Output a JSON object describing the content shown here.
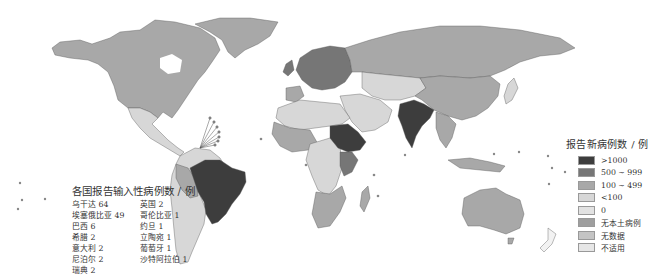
{
  "map": {
    "type": "choropleth",
    "subject": "world map of reported new cases",
    "colors": {
      "ocean": "#ffffff",
      "gt1000": "#3d3d3d",
      "r500_999": "#767676",
      "r100_499": "#a8a8a8",
      "lt100": "#d7d7d7",
      "zero": "#e2e2e2",
      "no_indigenous": "#9e9e9e",
      "no_data": "#c4c4c4",
      "not_applicable": "#e6e6e6",
      "border": "#555555"
    },
    "highlighted_countries_gt1000": [
      "Brazil",
      "India",
      "Sudan",
      "Ethiopia"
    ]
  },
  "import_panel": {
    "title": "各国报告输入性病例数 / 例",
    "left_column": [
      {
        "label": "乌干达 64"
      },
      {
        "label": "埃塞俄比亚 49"
      },
      {
        "label": "巴西 6"
      },
      {
        "label": "希腊 2"
      },
      {
        "label": "意大利 2"
      },
      {
        "label": "尼泊尔 2"
      },
      {
        "label": "瑞典 2"
      }
    ],
    "right_column": [
      {
        "label": "英国 2"
      },
      {
        "label": "哥伦比亚 1"
      },
      {
        "label": "约旦 1"
      },
      {
        "label": "立陶宛 1"
      },
      {
        "label": "葡萄牙 1"
      },
      {
        "label": "沙特阿拉伯 1"
      }
    ]
  },
  "legend": {
    "title": "报告新病例数 / 例",
    "items": [
      {
        "label": ">1000",
        "color": "#3d3d3d"
      },
      {
        "label": "500 ~ 999",
        "color": "#767676"
      },
      {
        "label": "100 ~ 499",
        "color": "#a8a8a8"
      },
      {
        "label": "<100",
        "color": "#d7d7d7"
      },
      {
        "label": "0",
        "color": "#e2e2e2"
      },
      {
        "label": "无本土病例",
        "color": "#9e9e9e"
      },
      {
        "label": "无数据",
        "color": "#c4c4c4"
      },
      {
        "label": "不适用",
        "color": "#e6e6e6"
      }
    ]
  }
}
